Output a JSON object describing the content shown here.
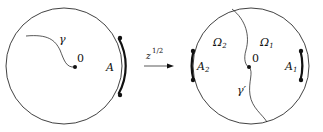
{
  "left_disk": {
    "curve_label": "γ",
    "origin_label": "0",
    "arc_label": "A"
  },
  "map": {
    "label_base": "z",
    "label_exponent": "1/2"
  },
  "right_disk": {
    "region1_label": "Ω",
    "region1_sub": "1",
    "region2_label": "Ω",
    "region2_sub": "2",
    "origin_label": "0",
    "curve_label": "γ′",
    "arc1_label": "A",
    "arc1_sub": "1",
    "arc2_label": "A",
    "arc2_sub": "2"
  },
  "colors": {
    "stroke": "#111111",
    "background": "#ffffff"
  }
}
